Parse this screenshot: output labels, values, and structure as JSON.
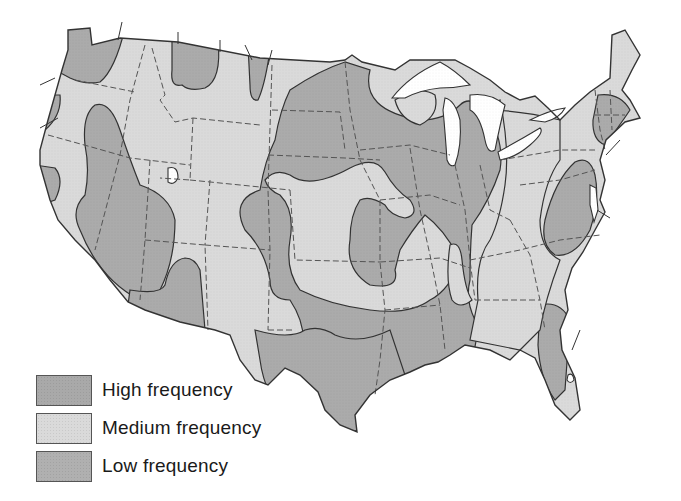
{
  "map": {
    "subject": "Contiguous United States",
    "features": [
      "state-boundaries",
      "frequency-zones",
      "great-lakes"
    ],
    "colors": {
      "high": "#a9a9a9",
      "medium": "#dadada",
      "low": "#b0b0b0",
      "water": "#ffffff",
      "outline": "#333333",
      "state_border": "#555555"
    }
  },
  "legend": {
    "items": [
      {
        "label": "High frequency",
        "color": "#a9a9a9"
      },
      {
        "label": "Medium frequency",
        "color": "#dadada"
      },
      {
        "label": "Low frequency",
        "color": "#b0b0b0"
      }
    ]
  }
}
